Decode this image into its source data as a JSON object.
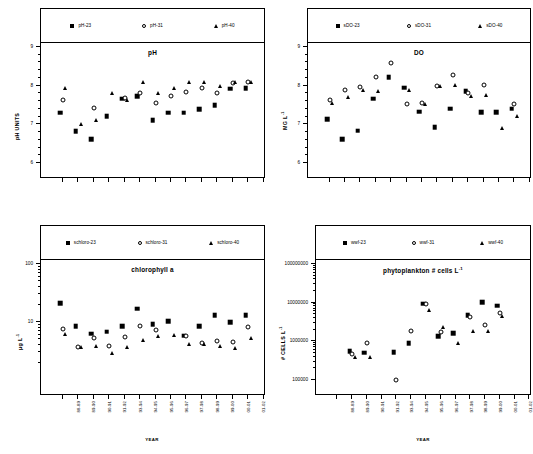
{
  "figure": {
    "categories": [
      "88-89",
      "89-90",
      "90-91",
      "91-92",
      "93-94",
      "94-95",
      "95-96",
      "96-97",
      "97-98",
      "98-99",
      "99-00",
      "00-01",
      "01-02"
    ],
    "xlabel": "YEAR"
  },
  "chart_data": [
    {
      "type": "scatter",
      "id": "ph",
      "title": "pH",
      "ylabel": "pH UNITS",
      "xlabel": "YEAR",
      "scale": "linear",
      "ylim": [
        6,
        9
      ],
      "yticks": [
        6,
        7,
        8,
        9
      ],
      "grid": false,
      "legend_position": "top",
      "categories": [
        "88-89",
        "89-90",
        "90-91",
        "91-92",
        "93-94",
        "94-95",
        "95-96",
        "96-97",
        "97-98",
        "98-99",
        "99-00",
        "00-01",
        "01-02"
      ],
      "series": [
        {
          "name": "pH-23",
          "marker": "square",
          "values": [
            7.3,
            6.83,
            6.62,
            7.21,
            7.66,
            7.73,
            7.11,
            7.3,
            7.3,
            7.39,
            7.49,
            7.92,
            7.93
          ]
        },
        {
          "name": "pH-31",
          "marker": "circle",
          "values": [
            7.62,
            null,
            7.42,
            null,
            7.67,
            7.8,
            7.54,
            7.74,
            7.83,
            7.93,
            7.82,
            8.08,
            8.1
          ]
        },
        {
          "name": "pH-40",
          "marker": "triangle",
          "values": [
            7.95,
            7.0,
            7.1,
            7.81,
            7.64,
            8.1,
            7.8,
            7.95,
            8.1,
            8.1,
            8.0,
            8.1,
            8.1
          ]
        }
      ]
    },
    {
      "type": "scatter",
      "id": "do",
      "title": "DO",
      "ylabel": "MG L-1",
      "xlabel": "YEAR",
      "scale": "linear",
      "ylim": [
        6,
        9
      ],
      "yticks": [
        6,
        7,
        8,
        9
      ],
      "grid": false,
      "legend_position": "top",
      "categories": [
        "88-89",
        "89-90",
        "90-91",
        "91-92",
        "93-94",
        "94-95",
        "95-96",
        "96-97",
        "97-98",
        "98-99",
        "99-00",
        "00-01",
        "01-02"
      ],
      "series": [
        {
          "name": "sDO-23",
          "marker": "square",
          "values": [
            7.13,
            6.62,
            6.84,
            7.66,
            8.22,
            7.95,
            7.33,
            6.93,
            7.4,
            7.85,
            7.32,
            7.31,
            7.4
          ]
        },
        {
          "name": "sDO-31",
          "marker": "circle",
          "values": [
            7.62,
            7.88,
            7.96,
            8.22,
            8.58,
            7.53,
            7.56,
            7.98,
            8.28,
            7.8,
            8.01,
            null,
            7.52
          ]
        },
        {
          "name": "sDO-40",
          "marker": "triangle",
          "values": [
            7.55,
            7.7,
            7.88,
            7.85,
            null,
            7.88,
            7.53,
            8.0,
            8.02,
            7.74,
            7.76,
            6.9,
            7.22
          ]
        }
      ]
    },
    {
      "type": "scatter",
      "id": "chlorophyll",
      "title": "chlorophyll a",
      "ylabel": "ug L-1",
      "xlabel": "YEAR",
      "scale": "log",
      "ylim": [
        1,
        100
      ],
      "yticks": [
        10,
        100
      ],
      "grid": false,
      "legend_position": "top",
      "categories": [
        "88-89",
        "89-90",
        "90-91",
        "91-92",
        "93-94",
        "94-95",
        "95-96",
        "96-97",
        "97-98",
        "98-99",
        "99-00",
        "00-01",
        "01-02"
      ],
      "series": [
        {
          "name": "schloro-23",
          "marker": "square",
          "values": [
            21.0,
            8.5,
            6.3,
            6.8,
            8.5,
            17.0,
            9.2,
            10.4,
            5.8,
            8.5,
            13.0,
            10.0,
            13.0
          ]
        },
        {
          "name": "schloro-31",
          "marker": "circle",
          "values": [
            7.5,
            3.7,
            5.2,
            3.8,
            5.6,
            8.7,
            7.2,
            null,
            5.7,
            4.3,
            4.7,
            4.6,
            8.2
          ]
        },
        {
          "name": "schloro-40",
          "marker": "triangle",
          "values": [
            6.2,
            3.7,
            3.8,
            2.9,
            3.7,
            4.8,
            5.7,
            5.9,
            4.1,
            4.2,
            3.8,
            3.5,
            5.4
          ]
        }
      ]
    },
    {
      "type": "scatter",
      "id": "phytoplankton",
      "title": "phytoplankton # cells L-1",
      "ylabel": "# CELLS L-1",
      "xlabel": "YEAR",
      "scale": "log",
      "ylim": [
        100000,
        100000000
      ],
      "yticks": [
        100000,
        1000000,
        10000000,
        100000000
      ],
      "grid": false,
      "legend_position": "top",
      "categories": [
        "88-89",
        "89-90",
        "90-91",
        "91-92",
        "93-94",
        "94-95",
        "95-96",
        "96-97",
        "97-98",
        "98-99",
        "99-00",
        "00-01",
        "01-02"
      ],
      "series": [
        {
          "name": "wwf-23",
          "marker": "square",
          "values": [
            null,
            560000,
            510000,
            null,
            530000,
            880000,
            9300000,
            1350000,
            1650000,
            4800000,
            10200000,
            8300000,
            null
          ]
        },
        {
          "name": "wwf-31",
          "marker": "circle",
          "values": [
            null,
            480000,
            900000,
            null,
            100000,
            1800000,
            9000000,
            1700000,
            null,
            4200000,
            2600000,
            5400000,
            null
          ]
        },
        {
          "name": "wwf-40",
          "marker": "triangle",
          "values": [
            null,
            400000,
            390000,
            null,
            null,
            null,
            6300000,
            2300000,
            930000,
            1900000,
            1900000,
            4400000,
            null
          ]
        }
      ]
    }
  ],
  "panels": {
    "ph": {
      "title": "pH",
      "ylabel_text": "pH UNITS",
      "ytick_labels": [
        "9",
        "8",
        "7",
        "6"
      ],
      "legend": [
        {
          "label": "pH-23",
          "marker": "square"
        },
        {
          "label": "pH-31",
          "marker": "circle"
        },
        {
          "label": "pH-40",
          "marker": "triangle"
        }
      ]
    },
    "do": {
      "title": "DO",
      "ylabel_main": "MG L",
      "ylabel_sup": "-1",
      "ytick_labels": [
        "9",
        "8",
        "7",
        "6"
      ],
      "legend": [
        {
          "label": "sDO-23",
          "marker": "square"
        },
        {
          "label": "sDO-31",
          "marker": "circle"
        },
        {
          "label": "sDO-40",
          "marker": "triangle"
        }
      ]
    },
    "chlorophyll": {
      "title": "chlorophyll a",
      "ylabel_main": "μg L",
      "ylabel_sup": "-1",
      "ytick_labels": [
        "100",
        "10"
      ],
      "xlabel": "YEAR",
      "legend": [
        {
          "label": "schloro-23",
          "marker": "square"
        },
        {
          "label": "schloro-31",
          "marker": "circle"
        },
        {
          "label": "schloro-40",
          "marker": "triangle"
        }
      ]
    },
    "phytoplankton": {
      "title_main": "phytoplankton # cells L",
      "title_sup": "-1",
      "ylabel_main": "# CELLS L",
      "ylabel_sup": "-1",
      "ytick_labels": [
        "100000000",
        "10000000",
        "1000000",
        "100000"
      ],
      "xlabel": "YEAR",
      "legend": [
        {
          "label": "wwf-23",
          "marker": "square"
        },
        {
          "label": "wwf-31",
          "marker": "circle"
        },
        {
          "label": "wwf-40",
          "marker": "triangle"
        }
      ]
    }
  }
}
